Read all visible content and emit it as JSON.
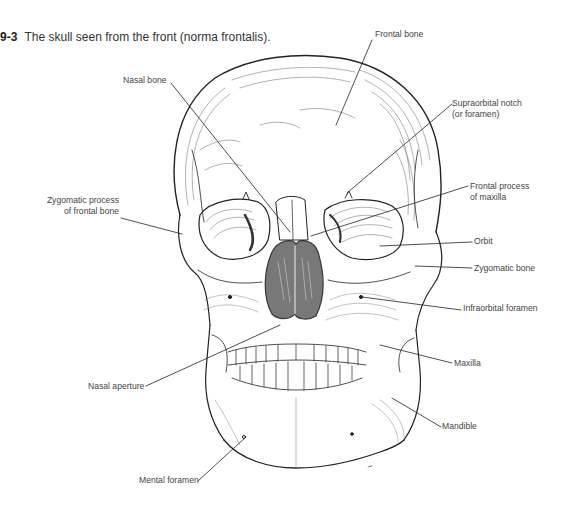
{
  "figure": {
    "number": "9-3",
    "caption": "The skull seen from the front (norma frontalis)."
  },
  "labels": {
    "frontal_bone": "Frontal bone",
    "nasal_bone": "Nasal bone",
    "supraorbital_notch_1": "Supraorbital notch",
    "supraorbital_notch_2": "(or foramen)",
    "zygomatic_process_1": "Zygomatic process",
    "zygomatic_process_2": "of frontal bone",
    "frontal_process_1": "Frontal process",
    "frontal_process_2": "of maxilla",
    "orbit": "Orbit",
    "zygomatic_bone": "Zygomatic bone",
    "infraorbital_foramen": "Infraorbital foramen",
    "maxilla": "Maxilla",
    "nasal_aperture": "Nasal aperture",
    "mandible": "Mandible",
    "mental_foramen": "Mental foramen"
  },
  "colors": {
    "ink": "#222222",
    "label_text": "#444444",
    "hatch": "#555555"
  }
}
